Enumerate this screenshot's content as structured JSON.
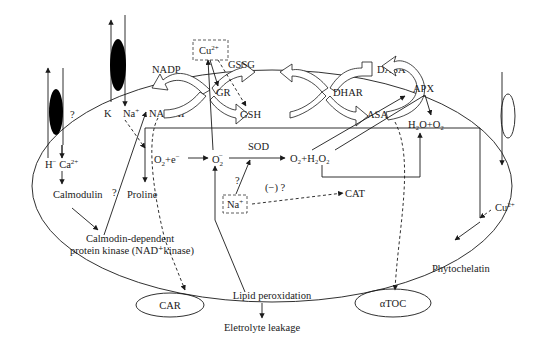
{
  "labels": {
    "nadp": "NADP",
    "nadph": "NADPII",
    "gssg": "GSSG",
    "gr": "GR",
    "gsh": "GSH",
    "dhar": "DHAR",
    "dasa": "DASA",
    "asa": "ASA",
    "apx": "APX",
    "cu_top": "Cu",
    "cu_top_sup": "2+",
    "k": "K",
    "na": "Na",
    "na_sup": "+",
    "q1": "?",
    "h_ca": "H",
    "h_sup": "−",
    "ca": " Ca",
    "ca_sup": "2+",
    "calmodulin": "Calmodulin",
    "q2": "?",
    "proline": "Proline",
    "o2e_a": "O",
    "o2e_sub": "2",
    "o2e_b": "+e",
    "o2e_sup": "−",
    "o2rad": "O",
    "o2rad_sub": "2",
    "o2rad_sup": "−",
    "sod": "SOD",
    "o2h2o2": "O₂+H₂O₂",
    "h2oo2": "H₂O+O₂",
    "q3": "?",
    "na_box": "Na",
    "na_box_sup": "+",
    "neg_q": "(−) ?",
    "cat": "CAT",
    "cu_right": "Cu",
    "cu_right_sup": "2+",
    "phytochelatin": "Phytochelatin",
    "cdpk_1": "Calmodin-dependent",
    "cdpk_2": "protein kinase (NAD⁺kinase)",
    "car": "CAR",
    "lipid": "Lipid peroxidation",
    "atoc": "αTOC",
    "leak": "Eletrolyte leakage"
  }
}
